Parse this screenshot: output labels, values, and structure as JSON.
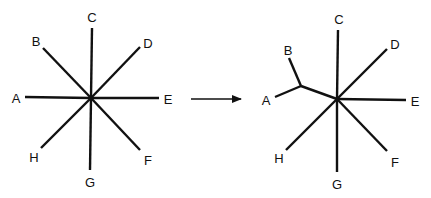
{
  "diagram": {
    "type": "tree-transformation",
    "colors": {
      "line": "#111111",
      "background": "#ffffff"
    },
    "left_tree": {
      "name": "star-tree",
      "center": [
        91,
        98
      ],
      "nodes": [
        {
          "id": "A",
          "label": "A",
          "end": [
            25,
            97
          ],
          "label_pos": [
            16,
            98
          ]
        },
        {
          "id": "B",
          "label": "B",
          "end": [
            43,
            48
          ],
          "label_pos": [
            36,
            41
          ]
        },
        {
          "id": "C",
          "label": "C",
          "end": [
            92,
            28
          ],
          "label_pos": [
            92,
            17
          ]
        },
        {
          "id": "D",
          "label": "D",
          "end": [
            140,
            47
          ],
          "label_pos": [
            148,
            43
          ]
        },
        {
          "id": "E",
          "label": "E",
          "end": [
            159,
            98
          ],
          "label_pos": [
            168,
            99
          ]
        },
        {
          "id": "F",
          "label": "F",
          "end": [
            140,
            150
          ],
          "label_pos": [
            148,
            160
          ]
        },
        {
          "id": "G",
          "label": "G",
          "end": [
            90,
            170
          ],
          "label_pos": [
            90,
            182
          ]
        },
        {
          "id": "H",
          "label": "H",
          "end": [
            41,
            148
          ],
          "label_pos": [
            34,
            157
          ]
        }
      ]
    },
    "arrow": {
      "from": [
        191,
        99
      ],
      "to": [
        241,
        99
      ]
    },
    "right_tree": {
      "name": "resolved-tree",
      "center": [
        337,
        99
      ],
      "internal_node": [
        301,
        86
      ],
      "nodes": [
        {
          "id": "A",
          "label": "A",
          "end": [
            275,
            97
          ],
          "label_pos": [
            266,
            100
          ],
          "parent": "internal"
        },
        {
          "id": "B",
          "label": "B",
          "end": [
            289,
            58
          ],
          "label_pos": [
            288,
            50
          ],
          "parent": "internal"
        },
        {
          "id": "C",
          "label": "C",
          "end": [
            338,
            30
          ],
          "label_pos": [
            339,
            19
          ],
          "parent": "center"
        },
        {
          "id": "D",
          "label": "D",
          "end": [
            387,
            49
          ],
          "label_pos": [
            395,
            44
          ],
          "parent": "center"
        },
        {
          "id": "E",
          "label": "E",
          "end": [
            406,
            100
          ],
          "label_pos": [
            415,
            101
          ],
          "parent": "center"
        },
        {
          "id": "F",
          "label": "F",
          "end": [
            387,
            151
          ],
          "label_pos": [
            395,
            162
          ],
          "parent": "center"
        },
        {
          "id": "G",
          "label": "G",
          "end": [
            337,
            172
          ],
          "label_pos": [
            337,
            184
          ],
          "parent": "center"
        },
        {
          "id": "H",
          "label": "H",
          "end": [
            286,
            150
          ],
          "label_pos": [
            279,
            158
          ],
          "parent": "center"
        }
      ]
    }
  }
}
